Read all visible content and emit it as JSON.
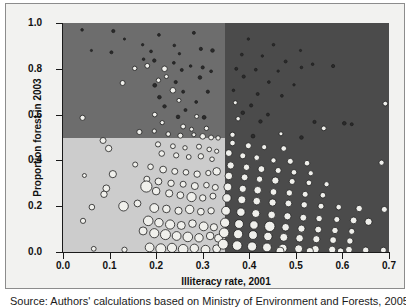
{
  "chart_data": {
    "type": "scatter",
    "title": "",
    "xlabel": "Illiteracy rate, 2001",
    "ylabel": "Proportion forest in 2003",
    "xlim": [
      0.0,
      0.7
    ],
    "ylim": [
      0.0,
      1.0
    ],
    "xticks": [
      "0.0",
      "0.1",
      "0.2",
      "0.3",
      "0.4",
      "0.5",
      "0.6",
      "0.7"
    ],
    "xtick_values": [
      0.0,
      0.1,
      0.2,
      0.3,
      0.4,
      0.5,
      0.6,
      0.7
    ],
    "yticks": [
      "0.0",
      "0.2",
      "0.4",
      "0.6",
      "0.8",
      "1.0"
    ],
    "ytick_values": [
      0.0,
      0.2,
      0.4,
      0.6,
      0.8,
      1.0
    ],
    "grid": false,
    "legend": "none",
    "marker_style": "open circles, light fill with dark outline, size-varying (bubble chart)",
    "quadrant_split_x": 0.347,
    "quadrant_split_y": 0.5,
    "quadrant_colors": {
      "top_left": "#6d6d6d",
      "top_right": "#4b4b4b",
      "bottom_left": "#cccccc",
      "bottom_right": "#4b4b4b"
    },
    "points": [
      {
        "x": 0.041,
        "y": 0.97,
        "r": 1.3
      },
      {
        "x": 0.108,
        "y": 0.965,
        "r": 1.6
      },
      {
        "x": 0.132,
        "y": 0.93,
        "r": 1.1
      },
      {
        "x": 0.206,
        "y": 0.948,
        "r": 1.4
      },
      {
        "x": 0.281,
        "y": 0.957,
        "r": 1.5
      },
      {
        "x": 0.171,
        "y": 0.905,
        "r": 1.2
      },
      {
        "x": 0.239,
        "y": 0.902,
        "r": 1.3
      },
      {
        "x": 0.296,
        "y": 0.887,
        "r": 1.6
      },
      {
        "x": 0.061,
        "y": 0.88,
        "r": 1.1
      },
      {
        "x": 0.104,
        "y": 0.872,
        "r": 1.5
      },
      {
        "x": 0.189,
        "y": 0.876,
        "r": 1.4
      },
      {
        "x": 0.25,
        "y": 0.866,
        "r": 1.2
      },
      {
        "x": 0.321,
        "y": 0.88,
        "r": 1.8
      },
      {
        "x": 0.173,
        "y": 0.842,
        "r": 1.3
      },
      {
        "x": 0.196,
        "y": 0.836,
        "r": 1.7
      },
      {
        "x": 0.238,
        "y": 0.826,
        "r": 1.4
      },
      {
        "x": 0.274,
        "y": 0.812,
        "r": 1.3
      },
      {
        "x": 0.3,
        "y": 0.806,
        "r": 1.6
      },
      {
        "x": 0.154,
        "y": 0.802,
        "r": 2.2
      },
      {
        "x": 0.181,
        "y": 0.813,
        "r": 2.4
      },
      {
        "x": 0.218,
        "y": 0.8,
        "r": 2.8
      },
      {
        "x": 0.255,
        "y": 0.795,
        "r": 1.5
      },
      {
        "x": 0.318,
        "y": 0.789,
        "r": 1.4
      },
      {
        "x": 0.222,
        "y": 0.766,
        "r": 2.0
      },
      {
        "x": 0.205,
        "y": 0.75,
        "r": 2.2
      },
      {
        "x": 0.242,
        "y": 0.742,
        "r": 1.6
      },
      {
        "x": 0.294,
        "y": 0.762,
        "r": 1.8
      },
      {
        "x": 0.128,
        "y": 0.738,
        "r": 2.5
      },
      {
        "x": 0.197,
        "y": 0.728,
        "r": 1.9
      },
      {
        "x": 0.236,
        "y": 0.706,
        "r": 2.8
      },
      {
        "x": 0.258,
        "y": 0.7,
        "r": 1.5
      },
      {
        "x": 0.311,
        "y": 0.7,
        "r": 1.6
      },
      {
        "x": 0.207,
        "y": 0.676,
        "r": 1.8
      },
      {
        "x": 0.249,
        "y": 0.662,
        "r": 2.0
      },
      {
        "x": 0.286,
        "y": 0.655,
        "r": 1.4
      },
      {
        "x": 0.218,
        "y": 0.636,
        "r": 1.7
      },
      {
        "x": 0.263,
        "y": 0.62,
        "r": 1.5
      },
      {
        "x": 0.042,
        "y": 0.586,
        "r": 2.6
      },
      {
        "x": 0.197,
        "y": 0.6,
        "r": 2.3
      },
      {
        "x": 0.247,
        "y": 0.59,
        "r": 1.8
      },
      {
        "x": 0.287,
        "y": 0.592,
        "r": 2.0
      },
      {
        "x": 0.303,
        "y": 0.588,
        "r": 1.9
      },
      {
        "x": 0.213,
        "y": 0.565,
        "r": 2.1
      },
      {
        "x": 0.258,
        "y": 0.548,
        "r": 2.4
      },
      {
        "x": 0.276,
        "y": 0.536,
        "r": 2.0
      },
      {
        "x": 0.308,
        "y": 0.54,
        "r": 2.2
      },
      {
        "x": 0.164,
        "y": 0.524,
        "r": 2.6
      },
      {
        "x": 0.196,
        "y": 0.528,
        "r": 2.1
      },
      {
        "x": 0.226,
        "y": 0.515,
        "r": 2.3
      },
      {
        "x": 0.252,
        "y": 0.508,
        "r": 2.5
      },
      {
        "x": 0.281,
        "y": 0.512,
        "r": 2.0
      },
      {
        "x": 0.3,
        "y": 0.505,
        "r": 2.8
      },
      {
        "x": 0.318,
        "y": 0.5,
        "r": 2.4
      },
      {
        "x": 0.333,
        "y": 0.498,
        "r": 2.2
      },
      {
        "x": 0.086,
        "y": 0.487,
        "r": 3.0
      },
      {
        "x": 0.098,
        "y": 0.452,
        "r": 3.2
      },
      {
        "x": 0.204,
        "y": 0.47,
        "r": 2.6
      },
      {
        "x": 0.236,
        "y": 0.462,
        "r": 2.4
      },
      {
        "x": 0.262,
        "y": 0.455,
        "r": 2.2
      },
      {
        "x": 0.292,
        "y": 0.46,
        "r": 2.5
      },
      {
        "x": 0.314,
        "y": 0.448,
        "r": 2.3
      },
      {
        "x": 0.33,
        "y": 0.44,
        "r": 2.1
      },
      {
        "x": 0.212,
        "y": 0.43,
        "r": 2.8
      },
      {
        "x": 0.243,
        "y": 0.422,
        "r": 2.6
      },
      {
        "x": 0.27,
        "y": 0.415,
        "r": 2.4
      },
      {
        "x": 0.296,
        "y": 0.418,
        "r": 2.7
      },
      {
        "x": 0.32,
        "y": 0.405,
        "r": 2.3
      },
      {
        "x": 0.155,
        "y": 0.382,
        "r": 2.5
      },
      {
        "x": 0.188,
        "y": 0.372,
        "r": 2.8
      },
      {
        "x": 0.215,
        "y": 0.36,
        "r": 3.4
      },
      {
        "x": 0.24,
        "y": 0.352,
        "r": 3.0
      },
      {
        "x": 0.264,
        "y": 0.348,
        "r": 2.8
      },
      {
        "x": 0.288,
        "y": 0.34,
        "r": 3.2
      },
      {
        "x": 0.312,
        "y": 0.345,
        "r": 2.6
      },
      {
        "x": 0.33,
        "y": 0.352,
        "r": 3.8
      },
      {
        "x": 0.046,
        "y": 0.334,
        "r": 2.0
      },
      {
        "x": 0.107,
        "y": 0.34,
        "r": 3.6
      },
      {
        "x": 0.18,
        "y": 0.318,
        "r": 3.0
      },
      {
        "x": 0.205,
        "y": 0.308,
        "r": 3.4
      },
      {
        "x": 0.232,
        "y": 0.3,
        "r": 3.2
      },
      {
        "x": 0.258,
        "y": 0.296,
        "r": 3.0
      },
      {
        "x": 0.283,
        "y": 0.288,
        "r": 3.5
      },
      {
        "x": 0.308,
        "y": 0.292,
        "r": 2.8
      },
      {
        "x": 0.327,
        "y": 0.282,
        "r": 3.0
      },
      {
        "x": 0.093,
        "y": 0.278,
        "r": 3.4
      },
      {
        "x": 0.088,
        "y": 0.252,
        "r": 3.2
      },
      {
        "x": 0.179,
        "y": 0.286,
        "r": 5.6
      },
      {
        "x": 0.2,
        "y": 0.266,
        "r": 3.8
      },
      {
        "x": 0.228,
        "y": 0.256,
        "r": 3.6
      },
      {
        "x": 0.252,
        "y": 0.248,
        "r": 3.4
      },
      {
        "x": 0.276,
        "y": 0.24,
        "r": 4.6
      },
      {
        "x": 0.3,
        "y": 0.236,
        "r": 3.2
      },
      {
        "x": 0.322,
        "y": 0.244,
        "r": 3.0
      },
      {
        "x": 0.062,
        "y": 0.196,
        "r": 2.8
      },
      {
        "x": 0.13,
        "y": 0.2,
        "r": 4.8
      },
      {
        "x": 0.16,
        "y": 0.212,
        "r": 3.4
      },
      {
        "x": 0.196,
        "y": 0.192,
        "r": 4.4
      },
      {
        "x": 0.222,
        "y": 0.188,
        "r": 3.8
      },
      {
        "x": 0.248,
        "y": 0.18,
        "r": 3.6
      },
      {
        "x": 0.272,
        "y": 0.186,
        "r": 4.2
      },
      {
        "x": 0.296,
        "y": 0.176,
        "r": 3.4
      },
      {
        "x": 0.318,
        "y": 0.18,
        "r": 3.2
      },
      {
        "x": 0.043,
        "y": 0.136,
        "r": 2.6
      },
      {
        "x": 0.183,
        "y": 0.136,
        "r": 4.8
      },
      {
        "x": 0.206,
        "y": 0.128,
        "r": 4.2
      },
      {
        "x": 0.23,
        "y": 0.12,
        "r": 4.6
      },
      {
        "x": 0.254,
        "y": 0.116,
        "r": 4.0
      },
      {
        "x": 0.278,
        "y": 0.124,
        "r": 3.8
      },
      {
        "x": 0.302,
        "y": 0.112,
        "r": 4.4
      },
      {
        "x": 0.324,
        "y": 0.108,
        "r": 3.6
      },
      {
        "x": 0.172,
        "y": 0.092,
        "r": 4.0
      },
      {
        "x": 0.196,
        "y": 0.082,
        "r": 4.6
      },
      {
        "x": 0.22,
        "y": 0.076,
        "r": 5.0
      },
      {
        "x": 0.244,
        "y": 0.07,
        "r": 4.4
      },
      {
        "x": 0.268,
        "y": 0.066,
        "r": 4.8
      },
      {
        "x": 0.292,
        "y": 0.062,
        "r": 4.2
      },
      {
        "x": 0.316,
        "y": 0.07,
        "r": 3.8
      },
      {
        "x": 0.334,
        "y": 0.06,
        "r": 4.0
      },
      {
        "x": 0.066,
        "y": 0.014,
        "r": 2.4
      },
      {
        "x": 0.132,
        "y": 0.01,
        "r": 2.6
      },
      {
        "x": 0.186,
        "y": 0.02,
        "r": 4.4
      },
      {
        "x": 0.21,
        "y": 0.014,
        "r": 5.0
      },
      {
        "x": 0.234,
        "y": 0.018,
        "r": 4.6
      },
      {
        "x": 0.258,
        "y": 0.012,
        "r": 4.8
      },
      {
        "x": 0.282,
        "y": 0.016,
        "r": 4.2
      },
      {
        "x": 0.306,
        "y": 0.01,
        "r": 4.4
      },
      {
        "x": 0.33,
        "y": 0.014,
        "r": 4.0
      },
      {
        "x": 0.398,
        "y": 0.93,
        "r": 1.2
      },
      {
        "x": 0.452,
        "y": 0.905,
        "r": 1.3
      },
      {
        "x": 0.51,
        "y": 0.88,
        "r": 1.1
      },
      {
        "x": 0.384,
        "y": 0.862,
        "r": 1.4
      },
      {
        "x": 0.428,
        "y": 0.856,
        "r": 1.2
      },
      {
        "x": 0.478,
        "y": 0.832,
        "r": 1.5
      },
      {
        "x": 0.536,
        "y": 0.82,
        "r": 1.3
      },
      {
        "x": 0.58,
        "y": 0.812,
        "r": 1.6
      },
      {
        "x": 0.372,
        "y": 0.8,
        "r": 1.5
      },
      {
        "x": 0.414,
        "y": 0.796,
        "r": 1.4
      },
      {
        "x": 0.462,
        "y": 0.79,
        "r": 1.2
      },
      {
        "x": 0.512,
        "y": 0.806,
        "r": 1.3
      },
      {
        "x": 0.388,
        "y": 0.766,
        "r": 1.6
      },
      {
        "x": 0.442,
        "y": 0.742,
        "r": 1.4
      },
      {
        "x": 0.496,
        "y": 0.73,
        "r": 1.2
      },
      {
        "x": 0.366,
        "y": 0.706,
        "r": 1.3
      },
      {
        "x": 0.418,
        "y": 0.69,
        "r": 1.5
      },
      {
        "x": 0.47,
        "y": 0.682,
        "r": 1.4
      },
      {
        "x": 0.37,
        "y": 0.652,
        "r": 2.0
      },
      {
        "x": 0.404,
        "y": 0.64,
        "r": 1.6
      },
      {
        "x": 0.692,
        "y": 0.648,
        "r": 2.4
      },
      {
        "x": 0.386,
        "y": 0.608,
        "r": 1.8
      },
      {
        "x": 0.44,
        "y": 0.6,
        "r": 1.5
      },
      {
        "x": 0.376,
        "y": 0.582,
        "r": 2.2
      },
      {
        "x": 0.424,
        "y": 0.57,
        "r": 1.7
      },
      {
        "x": 0.54,
        "y": 0.568,
        "r": 1.6
      },
      {
        "x": 0.604,
        "y": 0.562,
        "r": 1.8
      },
      {
        "x": 0.62,
        "y": 0.558,
        "r": 1.5
      },
      {
        "x": 0.364,
        "y": 0.512,
        "r": 2.6
      },
      {
        "x": 0.408,
        "y": 0.506,
        "r": 1.9
      },
      {
        "x": 0.468,
        "y": 0.516,
        "r": 2.0
      },
      {
        "x": 0.512,
        "y": 0.5,
        "r": 1.8
      },
      {
        "x": 0.56,
        "y": 0.54,
        "r": 2.4
      },
      {
        "x": 0.364,
        "y": 0.476,
        "r": 2.8
      },
      {
        "x": 0.398,
        "y": 0.464,
        "r": 3.0
      },
      {
        "x": 0.432,
        "y": 0.458,
        "r": 2.6
      },
      {
        "x": 0.474,
        "y": 0.452,
        "r": 2.8
      },
      {
        "x": 0.356,
        "y": 0.432,
        "r": 3.4
      },
      {
        "x": 0.386,
        "y": 0.42,
        "r": 3.0
      },
      {
        "x": 0.416,
        "y": 0.412,
        "r": 2.8
      },
      {
        "x": 0.452,
        "y": 0.4,
        "r": 2.6
      },
      {
        "x": 0.488,
        "y": 0.396,
        "r": 3.0
      },
      {
        "x": 0.524,
        "y": 0.388,
        "r": 2.8
      },
      {
        "x": 0.684,
        "y": 0.39,
        "r": 2.6
      },
      {
        "x": 0.36,
        "y": 0.378,
        "r": 3.6
      },
      {
        "x": 0.394,
        "y": 0.37,
        "r": 3.2
      },
      {
        "x": 0.426,
        "y": 0.362,
        "r": 3.4
      },
      {
        "x": 0.462,
        "y": 0.356,
        "r": 3.0
      },
      {
        "x": 0.496,
        "y": 0.348,
        "r": 2.8
      },
      {
        "x": 0.532,
        "y": 0.344,
        "r": 2.6
      },
      {
        "x": 0.356,
        "y": 0.332,
        "r": 3.8
      },
      {
        "x": 0.39,
        "y": 0.326,
        "r": 3.4
      },
      {
        "x": 0.422,
        "y": 0.318,
        "r": 3.2
      },
      {
        "x": 0.456,
        "y": 0.312,
        "r": 3.6
      },
      {
        "x": 0.492,
        "y": 0.308,
        "r": 3.0
      },
      {
        "x": 0.528,
        "y": 0.302,
        "r": 2.8
      },
      {
        "x": 0.566,
        "y": 0.296,
        "r": 2.6
      },
      {
        "x": 0.354,
        "y": 0.284,
        "r": 4.0
      },
      {
        "x": 0.386,
        "y": 0.276,
        "r": 3.6
      },
      {
        "x": 0.418,
        "y": 0.27,
        "r": 3.8
      },
      {
        "x": 0.452,
        "y": 0.262,
        "r": 3.4
      },
      {
        "x": 0.486,
        "y": 0.258,
        "r": 3.2
      },
      {
        "x": 0.52,
        "y": 0.252,
        "r": 3.0
      },
      {
        "x": 0.558,
        "y": 0.248,
        "r": 2.8
      },
      {
        "x": 0.352,
        "y": 0.236,
        "r": 4.2
      },
      {
        "x": 0.384,
        "y": 0.228,
        "r": 4.0
      },
      {
        "x": 0.416,
        "y": 0.222,
        "r": 3.8
      },
      {
        "x": 0.45,
        "y": 0.216,
        "r": 3.6
      },
      {
        "x": 0.484,
        "y": 0.212,
        "r": 3.4
      },
      {
        "x": 0.518,
        "y": 0.206,
        "r": 3.2
      },
      {
        "x": 0.554,
        "y": 0.2,
        "r": 3.0
      },
      {
        "x": 0.592,
        "y": 0.196,
        "r": 2.8
      },
      {
        "x": 0.636,
        "y": 0.19,
        "r": 3.2
      },
      {
        "x": 0.69,
        "y": 0.186,
        "r": 3.0
      },
      {
        "x": 0.35,
        "y": 0.18,
        "r": 4.4
      },
      {
        "x": 0.382,
        "y": 0.174,
        "r": 4.2
      },
      {
        "x": 0.414,
        "y": 0.168,
        "r": 4.0
      },
      {
        "x": 0.448,
        "y": 0.162,
        "r": 3.8
      },
      {
        "x": 0.482,
        "y": 0.156,
        "r": 3.6
      },
      {
        "x": 0.516,
        "y": 0.15,
        "r": 3.4
      },
      {
        "x": 0.55,
        "y": 0.146,
        "r": 3.2
      },
      {
        "x": 0.588,
        "y": 0.142,
        "r": 3.0
      },
      {
        "x": 0.624,
        "y": 0.138,
        "r": 3.4
      },
      {
        "x": 0.656,
        "y": 0.132,
        "r": 3.6
      },
      {
        "x": 0.348,
        "y": 0.128,
        "r": 4.6
      },
      {
        "x": 0.378,
        "y": 0.122,
        "r": 4.4
      },
      {
        "x": 0.41,
        "y": 0.118,
        "r": 4.2
      },
      {
        "x": 0.444,
        "y": 0.112,
        "r": 5.2
      },
      {
        "x": 0.478,
        "y": 0.108,
        "r": 3.8
      },
      {
        "x": 0.512,
        "y": 0.102,
        "r": 3.6
      },
      {
        "x": 0.548,
        "y": 0.098,
        "r": 3.4
      },
      {
        "x": 0.584,
        "y": 0.094,
        "r": 3.2
      },
      {
        "x": 0.62,
        "y": 0.09,
        "r": 3.0
      },
      {
        "x": 0.346,
        "y": 0.084,
        "r": 4.8
      },
      {
        "x": 0.376,
        "y": 0.078,
        "r": 4.6
      },
      {
        "x": 0.408,
        "y": 0.074,
        "r": 4.4
      },
      {
        "x": 0.44,
        "y": 0.068,
        "r": 4.2
      },
      {
        "x": 0.474,
        "y": 0.064,
        "r": 4.0
      },
      {
        "x": 0.508,
        "y": 0.06,
        "r": 3.8
      },
      {
        "x": 0.544,
        "y": 0.056,
        "r": 3.6
      },
      {
        "x": 0.58,
        "y": 0.052,
        "r": 3.4
      },
      {
        "x": 0.616,
        "y": 0.048,
        "r": 3.2
      },
      {
        "x": 0.344,
        "y": 0.034,
        "r": 5.0
      },
      {
        "x": 0.374,
        "y": 0.028,
        "r": 4.8
      },
      {
        "x": 0.406,
        "y": 0.024,
        "r": 4.6
      },
      {
        "x": 0.438,
        "y": 0.02,
        "r": 4.4
      },
      {
        "x": 0.472,
        "y": 0.016,
        "r": 4.2
      },
      {
        "x": 0.506,
        "y": 0.014,
        "r": 4.0
      },
      {
        "x": 0.542,
        "y": 0.012,
        "r": 3.8
      },
      {
        "x": 0.578,
        "y": 0.01,
        "r": 3.6
      },
      {
        "x": 0.614,
        "y": 0.01,
        "r": 3.4
      },
      {
        "x": 0.65,
        "y": 0.008,
        "r": 3.2
      },
      {
        "x": 0.688,
        "y": 0.008,
        "r": 3.0
      },
      {
        "x": 0.466,
        "y": 0.004,
        "r": 4.0
      },
      {
        "x": 0.53,
        "y": 0.004,
        "r": 3.6
      },
      {
        "x": 0.596,
        "y": 0.004,
        "r": 3.2
      }
    ]
  },
  "caption": {
    "source": "Source: Authors' calculations based on Ministry of Environment and Forests, 2005."
  }
}
